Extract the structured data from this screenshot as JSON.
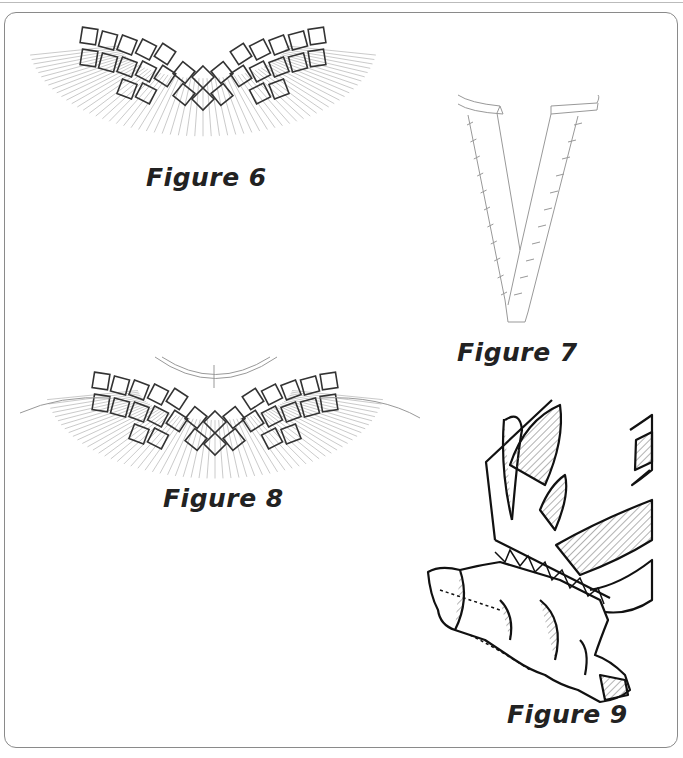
{
  "page": {
    "figures": [
      {
        "id": "figure-6",
        "caption": "Figure 6",
        "description": "Smocked yoke neckline with diamond honeycomb stitching over fan of gathering lines"
      },
      {
        "id": "figure-7",
        "caption": "Figure 7",
        "description": "V-shaped neck binding with tacking stitches"
      },
      {
        "id": "figure-8",
        "caption": "Figure 8",
        "description": "Smocked yoke on garment with neckband and shoulder lines"
      },
      {
        "id": "figure-9",
        "caption": "Figure 9",
        "description": "Close-up of smocked ruffle edge with hatched shading"
      }
    ]
  },
  "colors": {
    "line": "#333333",
    "light": "#b0b0b0",
    "frame": "#8a8a8a"
  }
}
